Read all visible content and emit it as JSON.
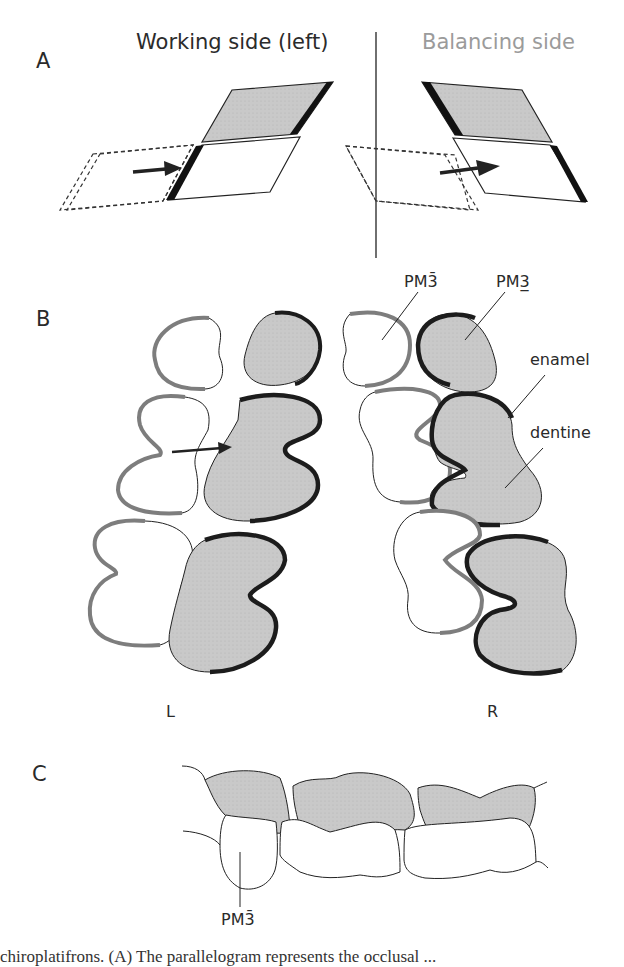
{
  "figure": {
    "panels": {
      "A": {
        "letter": "A",
        "working_title": "Working side (left)",
        "balancing_title": "Balancing side"
      },
      "B": {
        "letter": "B",
        "labels": {
          "lower_premolar": "PM3̄",
          "upper_premolar": "PM3̲",
          "enamel": "enamel",
          "dentine": "dentine"
        },
        "left_side": "L",
        "right_side": "R"
      },
      "C": {
        "letter": "C",
        "label_lower_premolar": "PM3̄"
      }
    },
    "caption_fragment": "chiroplatifrons. (A) The parallelogram represents the occlusal ..."
  },
  "colors": {
    "dentine_fill": "#c6c6c6",
    "enamel_dark": "#1c1c1c",
    "enamel_gray": "#7d7d7d",
    "balancing_title": "#9b9b9b"
  }
}
